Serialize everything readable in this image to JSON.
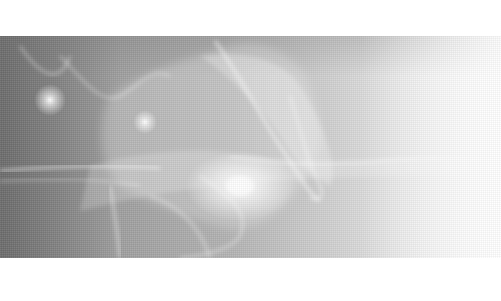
{
  "image": {
    "description": "Abstract grayscale photograph of glowing smoke / light wisps on a dark-to-white gradient",
    "colors": {
      "page_background": "#ffffff",
      "photo_dark": "#8a8a8a",
      "photo_light": "#ffffff",
      "highlight": "#ffffff"
    },
    "highlights": [
      {
        "name": "glow-spot-left",
        "x": 50,
        "y": 100
      },
      {
        "name": "glow-spot-center",
        "x": 145,
        "y": 122
      },
      {
        "name": "flare-bright",
        "x": 240,
        "y": 210
      }
    ]
  }
}
